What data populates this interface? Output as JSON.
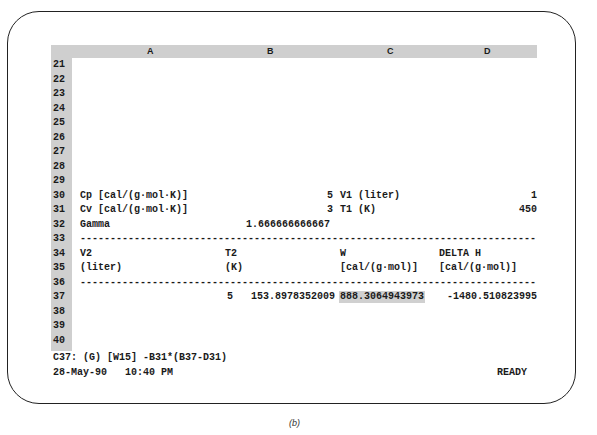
{
  "columns": [
    "A",
    "B",
    "C",
    "D"
  ],
  "rows": [
    "21",
    "22",
    "23",
    "24",
    "25",
    "26",
    "27",
    "28",
    "29",
    "30",
    "31",
    "32",
    "33",
    "34",
    "35",
    "36",
    "37",
    "38",
    "39",
    "40"
  ],
  "cells": {
    "A30": "Cp [cal/(g·mol·K)]",
    "B30": "5",
    "C30": "V1 (liter)",
    "D30": "1",
    "A31": "Cv [cal/(g·mol·K)]",
    "B31": "3",
    "C31": "T1 (K)",
    "D31": "450",
    "A32": "Gamma",
    "B32": "1.666666666667",
    "row33_dashes": "------------------------------------------------------------------------------------",
    "A34": "V2",
    "B34_T2": "T2",
    "C34": "W",
    "D34": "DELTA H",
    "A35": "(liter)",
    "B35_K": "(K)",
    "C35": "[cal/(g·mol)]",
    "D35": "[cal/(g·mol)]",
    "row36_dashes": "------------------------------------------------------------------------------------",
    "A37": "5",
    "B37": "153.8978352009",
    "C37": "888.3064943973",
    "D37": "-1480.510823995"
  },
  "status": {
    "cell_formula": "C37: (G) [W15] -B31*(B37-D31)",
    "datetime": "28-May-90   10:40 PM",
    "mode": "READY"
  },
  "selected_cell": "C37",
  "caption": "(b)"
}
